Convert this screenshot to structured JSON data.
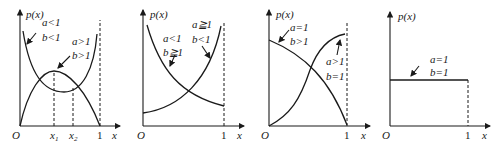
{
  "panels": [
    {
      "id": "panel-1",
      "y_label": "p(x)",
      "origin": "O",
      "x_label": "x",
      "one": "1",
      "x1": "x",
      "x1_sub": "1",
      "x2": "x",
      "x2_sub": "2",
      "curve_a": {
        "a": "a<1",
        "b": "b<1",
        "shape": "U-shaped"
      },
      "curve_b": {
        "a": "a>1",
        "b": "b>1",
        "shape": "unimodal"
      }
    },
    {
      "id": "panel-2",
      "y_label": "p(x)",
      "origin": "O",
      "x_label": "x",
      "one": "1",
      "curve_a": {
        "a": "a<1",
        "b": "b≧1",
        "shape": "decreasing"
      },
      "curve_b": {
        "a": "a≧1",
        "b": "b<1",
        "shape": "increasing"
      }
    },
    {
      "id": "panel-3",
      "y_label": "p(x)",
      "origin": "O",
      "x_label": "x",
      "one": "1",
      "curve_a": {
        "a": "a=1",
        "b": "b>1",
        "shape": "decreasing concave"
      },
      "curve_b": {
        "a": "a>1",
        "b": "b=1",
        "shape": "increasing concave"
      }
    },
    {
      "id": "panel-4",
      "y_label": "p(x)",
      "origin": "O",
      "x_label": "x",
      "one": "1",
      "curve_a": {
        "a": "a=1",
        "b": "b=1",
        "shape": "uniform"
      }
    }
  ]
}
